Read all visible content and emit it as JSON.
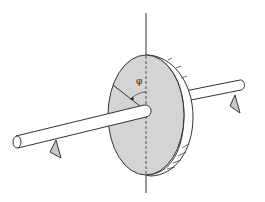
{
  "diagram": {
    "angle_label": "φ",
    "colors": {
      "stroke": "#333333",
      "disc_fill": "#d4d4d4",
      "rim_fill": "#ffffff",
      "shaft_fill": "#ffffff",
      "support_fill": "#c8c8c8"
    }
  }
}
